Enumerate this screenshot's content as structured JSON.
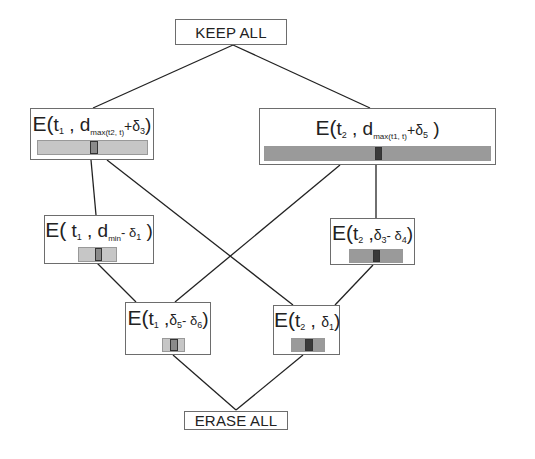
{
  "diagram": {
    "type": "lattice",
    "colors": {
      "border": "#6d6d6d",
      "edge": "#222222",
      "bar_light": "#c6c6c6",
      "bar_dark": "#9a9a9a",
      "marker_light": "#8a8a8a",
      "marker_dark": "#3a3a3a"
    },
    "top": {
      "label": "KEEP ALL"
    },
    "bottom": {
      "label": "ERASE ALL"
    },
    "nodes": [
      {
        "id": "n1",
        "E": "E(",
        "t": "t",
        "t_sub": "1",
        "sep": " , ",
        "arg": "d",
        "arg_sub": "max(t2, t)",
        "rest": "+δ",
        "rest_sub": "3",
        "close": ")"
      },
      {
        "id": "n2",
        "E": "E(",
        "t": "t",
        "t_sub": "2",
        "sep": " , ",
        "arg": "d",
        "arg_sub": "max(t1, t)",
        "rest": "+δ",
        "rest_sub": "5",
        "close": " )"
      },
      {
        "id": "n3",
        "E": "E(",
        "t": " t",
        "t_sub": "1",
        "sep": " , ",
        "arg": "d",
        "arg_sub": "min",
        "rest": "- δ",
        "rest_sub": "1",
        "close": " )"
      },
      {
        "id": "n4",
        "E": "E(",
        "t": "t",
        "t_sub": "2",
        "sep": " ,",
        "arg": "δ",
        "arg_sub": "3",
        "rest": "- δ",
        "rest_sub": "4",
        "close": ")"
      },
      {
        "id": "n5",
        "E": "E(",
        "t": "t",
        "t_sub": "1",
        "sep": " ,",
        "arg": "δ",
        "arg_sub": "5",
        "rest": "- δ",
        "rest_sub": "6",
        "close": ")"
      },
      {
        "id": "n6",
        "E": "E(",
        "t": "t",
        "t_sub": "2",
        "sep": " , ",
        "arg": "δ",
        "arg_sub": "1",
        "rest": "",
        "rest_sub": "",
        "close": ")"
      }
    ],
    "edges": [
      [
        "KEEP ALL",
        "n1"
      ],
      [
        "KEEP ALL",
        "n2"
      ],
      [
        "n1",
        "n3"
      ],
      [
        "n1",
        "n6"
      ],
      [
        "n2",
        "n5"
      ],
      [
        "n2",
        "n4"
      ],
      [
        "n3",
        "n5"
      ],
      [
        "n4",
        "n6"
      ],
      [
        "n5",
        "ERASE ALL"
      ],
      [
        "n6",
        "ERASE ALL"
      ]
    ]
  }
}
